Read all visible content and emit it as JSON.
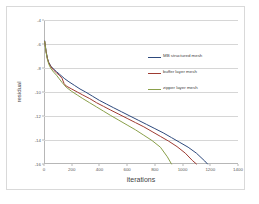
{
  "chart_data": {
    "type": "line",
    "title": "",
    "xlabel": "iterations",
    "ylabel": "residual",
    "xlim": [
      0,
      1400
    ],
    "ylim": [
      -16,
      -4
    ],
    "xticks": [
      0,
      200,
      400,
      600,
      800,
      1000,
      1200,
      1400
    ],
    "yticks": [
      -4,
      -6,
      -8,
      -10,
      -12,
      -14,
      -16
    ],
    "grid": "horizontal",
    "legend_position": "inside-right",
    "series": [
      {
        "name": "MB structured mesh",
        "color": "#2e4a7d",
        "x": [
          5,
          15,
          25,
          35,
          50,
          70,
          90,
          110,
          130,
          150,
          180,
          220,
          260,
          300,
          350,
          400,
          450,
          500,
          560,
          620,
          680,
          740,
          800,
          860,
          920,
          980,
          1040,
          1100,
          1160,
          1180
        ],
        "y": [
          -5.75,
          -6.6,
          -7.2,
          -7.55,
          -7.85,
          -8.1,
          -8.3,
          -8.5,
          -8.7,
          -8.9,
          -9.15,
          -9.45,
          -9.75,
          -10.0,
          -10.35,
          -10.7,
          -11.0,
          -11.3,
          -11.65,
          -12.0,
          -12.35,
          -12.7,
          -13.05,
          -13.4,
          -13.8,
          -14.2,
          -14.6,
          -15.1,
          -15.75,
          -16.0
        ]
      },
      {
        "name": "buffer layer mesh",
        "color": "#9e3b32",
        "x": [
          5,
          15,
          25,
          35,
          50,
          70,
          90,
          110,
          130,
          145,
          160,
          200,
          240,
          280,
          330,
          380,
          430,
          480,
          540,
          600,
          660,
          720,
          780,
          840,
          900,
          960,
          1020,
          1070,
          1100
        ],
        "y": [
          -5.78,
          -6.65,
          -7.25,
          -7.6,
          -7.9,
          -8.18,
          -8.4,
          -8.6,
          -8.85,
          -9.3,
          -9.5,
          -9.75,
          -10.0,
          -10.25,
          -10.55,
          -10.9,
          -11.2,
          -11.5,
          -11.85,
          -12.2,
          -12.55,
          -12.9,
          -13.3,
          -13.7,
          -14.1,
          -14.55,
          -15.1,
          -15.7,
          -16.0
        ]
      },
      {
        "name": "zipper layer mesh",
        "color": "#8aa04a",
        "x": [
          5,
          15,
          25,
          35,
          50,
          70,
          90,
          110,
          130,
          160,
          200,
          240,
          280,
          330,
          380,
          430,
          480,
          540,
          600,
          660,
          720,
          780,
          840,
          890,
          920
        ],
        "y": [
          -5.8,
          -6.7,
          -7.3,
          -7.7,
          -8.05,
          -8.35,
          -8.6,
          -8.9,
          -9.2,
          -9.6,
          -9.95,
          -10.25,
          -10.55,
          -10.9,
          -11.25,
          -11.6,
          -11.95,
          -12.35,
          -12.75,
          -13.15,
          -13.6,
          -14.05,
          -14.6,
          -15.4,
          -16.0
        ]
      }
    ]
  }
}
